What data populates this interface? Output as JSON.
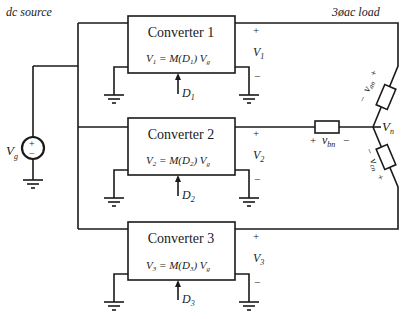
{
  "labels": {
    "dc_source": "dc source",
    "ac_load": "3øac load",
    "source_symbol": "V",
    "source_sub": "g",
    "source_plus": "+",
    "source_minus": "−",
    "neutral_V": "V",
    "neutral_sub": "n"
  },
  "converters": [
    {
      "title": "Converter 1",
      "eq_lhs": "V",
      "eq_lhs_sub": "1",
      "eq_mid": " = M(D",
      "eq_mid_sub": "1",
      "eq_rhs": ") V",
      "eq_rhs_sub": "g",
      "duty": "D",
      "duty_sub": "1",
      "out_V": "V",
      "out_sub": "1",
      "plus": "+",
      "minus": "−"
    },
    {
      "title": "Converter 2",
      "eq_lhs": "V",
      "eq_lhs_sub": "2",
      "eq_mid": " = M(D",
      "eq_mid_sub": "2",
      "eq_rhs": ") V",
      "eq_rhs_sub": "g",
      "duty": "D",
      "duty_sub": "2",
      "out_V": "V",
      "out_sub": "2",
      "plus": "+",
      "minus": "−"
    },
    {
      "title": "Converter 3",
      "eq_lhs": "V",
      "eq_lhs_sub": "3",
      "eq_mid": " = M(D",
      "eq_mid_sub": "3",
      "eq_rhs": ") V",
      "eq_rhs_sub": "g",
      "duty": "D",
      "duty_sub": "3",
      "out_V": "V",
      "out_sub": "3",
      "plus": "+",
      "minus": "−"
    }
  ],
  "load": {
    "an": {
      "v": "v",
      "sub": "an",
      "plus": "+",
      "minus": "−"
    },
    "bn": {
      "v": "v",
      "sub": "bn",
      "plus": "+",
      "minus": "−"
    },
    "cn": {
      "v": "v",
      "sub": "cn",
      "plus": "+",
      "minus": "−"
    }
  }
}
